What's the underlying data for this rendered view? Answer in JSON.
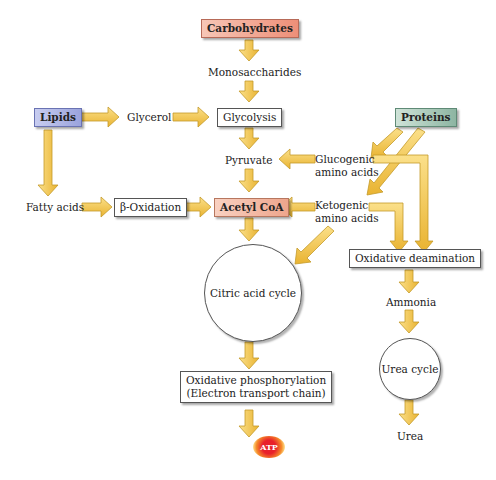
{
  "diagram": {
    "colors": {
      "arrow_fill": "#f5c542",
      "arrow_stroke": "#c49a2a",
      "carbohydrates": "#ee8f78",
      "lipids": "#9aa3dc",
      "proteins": "#8db5a2",
      "acetyl_coa": "#eea58c"
    },
    "nodes": {
      "carbohydrates": "Carbohydrates",
      "monosaccharides": "Monosaccharides",
      "lipids": "Lipids",
      "glycerol": "Glycerol",
      "glycolysis": "Glycolysis",
      "proteins": "Proteins",
      "pyruvate": "Pyruvate",
      "glucogenic_1": "Glucogenic",
      "glucogenic_2": "amino acids",
      "fatty_acids": "Fatty acids",
      "beta_oxidation": "β-Oxidation",
      "acetyl_coa": "Acetyl CoA",
      "ketogenic_1": "Ketogenic",
      "ketogenic_2": "amino acids",
      "citric_acid_cycle": "Citric acid cycle",
      "oxidative_deamination": "Oxidative deamination",
      "ammonia": "Ammonia",
      "urea_cycle": "Urea cycle",
      "urea": "Urea",
      "ox_phos_1": "Oxidative phosphorylation",
      "ox_phos_2": "(Electron transport chain)",
      "atp": "ATP"
    },
    "edges": [
      [
        "Carbohydrates",
        "Monosaccharides"
      ],
      [
        "Monosaccharides",
        "Glycolysis"
      ],
      [
        "Lipids",
        "Glycerol"
      ],
      [
        "Glycerol",
        "Glycolysis"
      ],
      [
        "Lipids",
        "Fatty acids"
      ],
      [
        "Fatty acids",
        "β-Oxidation"
      ],
      [
        "β-Oxidation",
        "Acetyl CoA"
      ],
      [
        "Glycolysis",
        "Pyruvate"
      ],
      [
        "Pyruvate",
        "Acetyl CoA"
      ],
      [
        "Proteins",
        "Glucogenic amino acids"
      ],
      [
        "Proteins",
        "Ketogenic amino acids"
      ],
      [
        "Glucogenic amino acids",
        "Pyruvate"
      ],
      [
        "Ketogenic amino acids",
        "Acetyl CoA"
      ],
      [
        "Ketogenic amino acids",
        "Citric acid cycle"
      ],
      [
        "Glucogenic amino acids",
        "Oxidative deamination"
      ],
      [
        "Ketogenic amino acids",
        "Oxidative deamination"
      ],
      [
        "Acetyl CoA",
        "Citric acid cycle"
      ],
      [
        "Citric acid cycle",
        "Oxidative phosphorylation"
      ],
      [
        "Oxidative phosphorylation",
        "ATP"
      ],
      [
        "Oxidative deamination",
        "Ammonia"
      ],
      [
        "Ammonia",
        "Urea cycle"
      ],
      [
        "Urea cycle",
        "Urea"
      ]
    ]
  }
}
